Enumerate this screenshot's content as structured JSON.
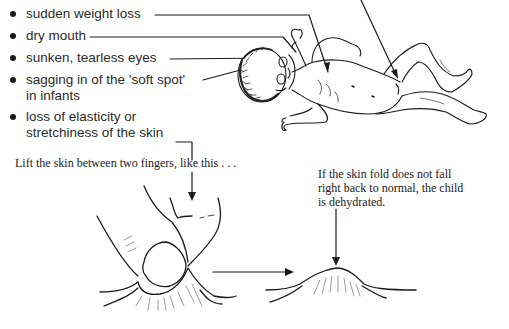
{
  "signs_list": {
    "items": [
      {
        "label": "sudden weight loss"
      },
      {
        "label": "dry mouth"
      },
      {
        "label": "sunken, tearless eyes"
      },
      {
        "label_line1": "sagging in of the 'soft spot'",
        "label_line2": "in infants"
      },
      {
        "label_line1": "loss of elasticity or",
        "label_line2": "stretchiness of the skin"
      }
    ]
  },
  "skin_test": {
    "instruction": "Lift the skin between two fingers, like this . . .",
    "result_line1": "If the skin fold does not fall",
    "result_line2": "right back to normal, the child",
    "result_line3": "is dehydrated."
  },
  "illustrations": {
    "child": "dehydrated-child-lying-down",
    "pinch": "fingers-pinching-skin",
    "fold": "raised-skin-fold"
  }
}
